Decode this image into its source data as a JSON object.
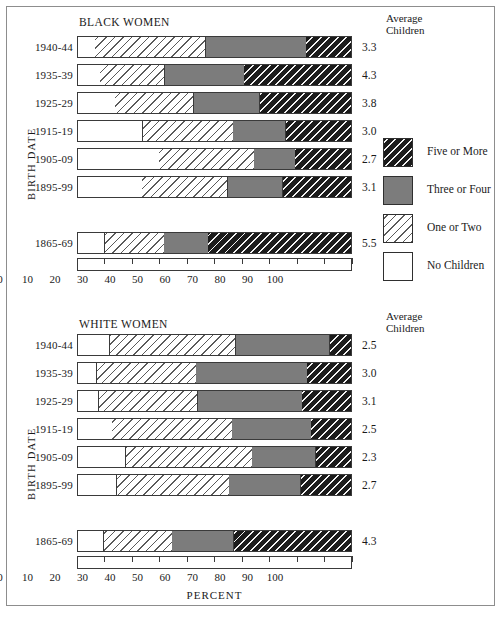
{
  "figure": {
    "panels": [
      {
        "title": "BLACK WOMEN",
        "y_axis_title": "BIRTH DATE",
        "avg_header_line1": "Average",
        "avg_header_line2": "Children",
        "x_axis_title": "",
        "rows": [
          {
            "label": "1940-44",
            "avg": "3.3",
            "none": 6.3,
            "onetwo": 40.2,
            "three": 36.5,
            "five": 17.0
          },
          {
            "label": "1935-39",
            "avg": "4.3",
            "none": 8.0,
            "onetwo": 23.6,
            "three": 28.8,
            "five": 39.6
          },
          {
            "label": "1925-29",
            "avg": "3.8",
            "none": 13.5,
            "onetwo": 28.5,
            "three": 24.0,
            "five": 34.0
          },
          {
            "label": "1915-19",
            "avg": "3.0",
            "none": 23.6,
            "onetwo": 32.9,
            "three": 19.1,
            "five": 24.4
          },
          {
            "label": "1905-09",
            "avg": "2.7",
            "none": 29.5,
            "onetwo": 34.5,
            "three": 15.0,
            "five": 21.0
          },
          {
            "label": "1895-99",
            "avg": "3.1",
            "none": 23.3,
            "onetwo": 31.2,
            "three": 20.0,
            "five": 25.5
          },
          {
            "label": "1865-69",
            "avg": "5.5",
            "none": 9.8,
            "onetwo": 21.5,
            "three": 16.0,
            "five": 52.7
          }
        ]
      },
      {
        "title": "WHITE WOMEN",
        "y_axis_title": "BIRTH DATE",
        "avg_header_line1": "Average",
        "avg_header_line2": "Children",
        "x_axis_title": "PERCENT",
        "rows": [
          {
            "label": "1940-44",
            "avg": "2.5",
            "none": 11.5,
            "onetwo": 45.8,
            "three": 34.2,
            "five": 8.5
          },
          {
            "label": "1935-39",
            "avg": "3.0",
            "none": 6.9,
            "onetwo": 36.1,
            "three": 40.4,
            "five": 16.6
          },
          {
            "label": "1925-29",
            "avg": "3.1",
            "none": 7.6,
            "onetwo": 36.0,
            "three": 37.9,
            "five": 18.5
          },
          {
            "label": "1915-19",
            "avg": "2.5",
            "none": 12.4,
            "onetwo": 43.6,
            "three": 28.8,
            "five": 15.2
          },
          {
            "label": "1905-09",
            "avg": "2.3",
            "none": 17.4,
            "onetwo": 45.9,
            "three": 23.1,
            "five": 13.6
          },
          {
            "label": "1895-99",
            "avg": "2.7",
            "none": 14.0,
            "onetwo": 41.0,
            "three": 26.0,
            "five": 19.0
          },
          {
            "label": "1865-69",
            "avg": "4.3",
            "none": 9.4,
            "onetwo": 24.8,
            "three": 22.5,
            "five": 43.3
          }
        ]
      }
    ],
    "x_ticks": [
      "0",
      "10",
      "20",
      "30",
      "40",
      "50",
      "60",
      "70",
      "80",
      "90",
      "100"
    ],
    "legend": [
      {
        "label": "Five or More",
        "key": "five"
      },
      {
        "label": "Three or Four",
        "key": "three"
      },
      {
        "label": "One or Two",
        "key": "onetwo"
      },
      {
        "label": "No Children",
        "key": "none"
      }
    ],
    "colors": {
      "five": "#1b1b1b",
      "three": "#7c7c7c",
      "onetwo": "#ffffff",
      "none": "#ffffff",
      "outline": "#3a3a3a",
      "text": "#1a1a1a",
      "background": "#ffffff"
    }
  },
  "chart_data": {
    "type": "bar",
    "subtype": "stacked-horizontal-100pct",
    "xlabel": "PERCENT",
    "ylabel": "BIRTH DATE",
    "xlim": [
      0,
      100
    ],
    "x_ticks": [
      0,
      10,
      20,
      30,
      40,
      50,
      60,
      70,
      80,
      90,
      100
    ],
    "grid": false,
    "legend_position": "right",
    "series_names": [
      "No Children",
      "One or Two",
      "Three or Four",
      "Five or More"
    ],
    "panels": [
      {
        "name": "BLACK WOMEN",
        "categories": [
          "1940-44",
          "1935-39",
          "1925-29",
          "1915-19",
          "1905-09",
          "1895-99",
          "1865-69"
        ],
        "series": [
          {
            "name": "No Children",
            "values": [
              6.3,
              8.0,
              13.5,
              23.6,
              29.5,
              23.3,
              9.8
            ]
          },
          {
            "name": "One or Two",
            "values": [
              40.2,
              23.6,
              28.5,
              32.9,
              34.5,
              31.2,
              21.5
            ]
          },
          {
            "name": "Three or Four",
            "values": [
              36.5,
              28.8,
              24.0,
              19.1,
              15.0,
              20.0,
              16.0
            ]
          },
          {
            "name": "Five or More",
            "values": [
              17.0,
              39.6,
              34.0,
              24.4,
              21.0,
              25.5,
              52.7
            ]
          }
        ],
        "average_children": [
          3.3,
          4.3,
          3.8,
          3.0,
          2.7,
          3.1,
          5.5
        ]
      },
      {
        "name": "WHITE WOMEN",
        "categories": [
          "1940-44",
          "1935-39",
          "1925-29",
          "1915-19",
          "1905-09",
          "1895-99",
          "1865-69"
        ],
        "series": [
          {
            "name": "No Children",
            "values": [
              11.5,
              6.9,
              7.6,
              12.4,
              17.4,
              14.0,
              9.4
            ]
          },
          {
            "name": "One or Two",
            "values": [
              45.8,
              36.1,
              36.0,
              43.6,
              45.9,
              41.0,
              24.8
            ]
          },
          {
            "name": "Three or Four",
            "values": [
              34.2,
              40.4,
              37.9,
              28.8,
              23.1,
              26.0,
              22.5
            ]
          },
          {
            "name": "Five or More",
            "values": [
              8.5,
              16.6,
              18.5,
              15.2,
              13.6,
              19.0,
              43.3
            ]
          }
        ],
        "average_children": [
          2.5,
          3.0,
          3.1,
          2.5,
          2.3,
          2.7,
          4.3
        ]
      }
    ]
  }
}
